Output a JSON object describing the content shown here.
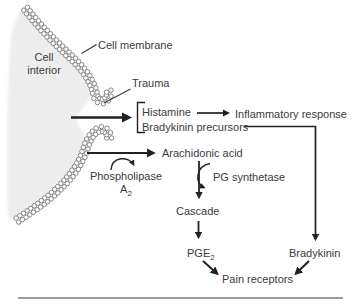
{
  "labels": {
    "cell_interior_line1": "Cell",
    "cell_interior_line2": "interior",
    "cell_membrane": "Cell membrane",
    "trauma": "Trauma",
    "histamine": "Histamine",
    "bradykinin_precursors": "Bradykinin precursors",
    "inflammatory_response": "Inflammatory response",
    "arachidonic_acid": "Arachidonic acid",
    "phospholipase": "Phospholipase",
    "phospholipase_sub_base": "A",
    "phospholipase_sub": "2",
    "pg_synthetase": "PG synthetase",
    "cascade": "Cascade",
    "pge_base": "PGE",
    "pge_sub": "2",
    "bradykinin": "Bradykinin",
    "pain_receptors": "Pain receptors"
  },
  "arrows": [
    {
      "from": "Cell interior (trauma site)",
      "to": "Histamine / Bradykinin precursors"
    },
    {
      "from": "Histamine",
      "to": "Inflammatory response"
    },
    {
      "from": "Bradykinin precursors",
      "to": "Bradykinin"
    },
    {
      "from": "Cell membrane",
      "to": "Arachidonic acid",
      "via": "Phospholipase A2"
    },
    {
      "from": "Arachidonic acid",
      "to": "Cascade",
      "via": "PG synthetase"
    },
    {
      "from": "Cascade",
      "to": "PGE2"
    },
    {
      "from": "PGE2",
      "to": "Pain receptors"
    },
    {
      "from": "Bradykinin",
      "to": "Pain receptors"
    }
  ],
  "colors": {
    "background": "#ffffff",
    "cell_interior_fill": "#ededed",
    "text": "#3c3c3c",
    "arrow": "#222222",
    "membrane_circle_stroke": "#7a7a7a",
    "bottom_rule": "#9c9c9c"
  }
}
